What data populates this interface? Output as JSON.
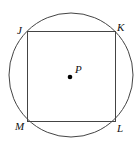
{
  "diagram": {
    "type": "inscribed-square-in-circle",
    "circle": {
      "center_label": "P"
    },
    "square": {
      "vertices": [
        "J",
        "K",
        "L",
        "M"
      ]
    },
    "labels": {
      "J": "J",
      "K": "K",
      "L": "L",
      "M": "M",
      "P": "P"
    },
    "colors": {
      "stroke": "#444444",
      "text": "#111111",
      "point": "#000000"
    }
  }
}
